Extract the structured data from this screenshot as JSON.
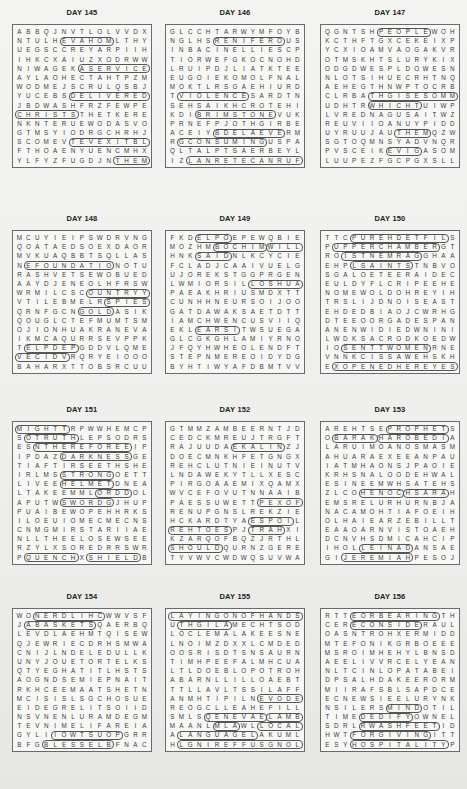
{
  "puzzles": [
    {
      "title": "DAY 145",
      "rows": [
        "ABBQJNVTLOLVVDX",
        "NTULHEVAHOMLTHY",
        "UEGSCCREYARPIIH",
        "IHKCXAIUZXODRWW",
        "NIWAGEKASERVICE",
        "AYLAOHECTAHTPZM",
        "WODMEJSCRULQSBJ",
        "YUCEBSDELIVERED",
        "JBDWASHFRZFEWPE",
        "CHRISTSTHETKERE",
        "NKNTERUEWODASVO",
        "GTMSYIODRGCHRHJ",
        "SCOMEVTEVEXITBL",
        "FTHOAENYUENCMHX",
        "YLFYZFUGDJNTHEM"
      ],
      "highlights": [
        {
          "row": 4,
          "col": 7,
          "len": 8,
          "angle": 0
        },
        {
          "row": 7,
          "col": 6,
          "len": 9,
          "angle": 0
        },
        {
          "row": 9,
          "col": 0,
          "len": 7,
          "angle": 0
        },
        {
          "row": 12,
          "col": 6,
          "len": 9,
          "angle": 0
        },
        {
          "row": 1,
          "col": 5,
          "len": 6,
          "angle": 0
        },
        {
          "row": 14,
          "col": 11,
          "len": 4,
          "angle": 0
        }
      ]
    },
    {
      "title": "DAY 146",
      "rows": [
        "GLCCHTARWYMFOYB",
        "NGLHSRENIFEROUS",
        "INBACINELLIESCP",
        "TIORWEFGKOCNOHD",
        "LRUIPDJLIATKTEE",
        "EUGOIEKOMOLFNAL",
        "MOKTLRSGAEHIURD",
        "TVIOLENCESARDTN",
        "SEHSAIKHCROTEHI",
        "KDIBRIMSTONEVUK",
        "PRNEFPJOTHGIRBE",
        "ACEIYBDELAEVERM",
        "RGCONSUMINGUSPA",
        "QLTALPTSAERBEYL",
        "IZLANRETECANRUF"
      ],
      "highlights": [
        {
          "row": 1,
          "col": 5,
          "len": 8,
          "angle": 0
        },
        {
          "row": 9,
          "col": 3,
          "len": 9,
          "angle": 0
        },
        {
          "row": 11,
          "col": 5,
          "len": 8,
          "angle": 0
        },
        {
          "row": 12,
          "col": 1,
          "len": 10,
          "angle": 0
        },
        {
          "row": 7,
          "col": 1,
          "len": 8,
          "angle": 0
        },
        {
          "row": 14,
          "col": 2,
          "len": 13,
          "angle": 0
        }
      ]
    },
    {
      "title": "DAY 147",
      "rows": [
        "QGNTSHPEOPLEWOH",
        "KCTHFTGXCEKEIXP",
        "YCXIOAMVAOGAKVR",
        "OTMSKHTSLURYKIX",
        "ODGDWESPLDOWESN",
        "NLOTSIHUECRHTNQ",
        "AEHEGTHNWPTOCRB",
        "CLRBATHGISESOMM",
        "UDHTRWHICHTUIWP",
        "LVREDNAGUSAITWZ",
        "REUVIIOANUYPIDD",
        "UYRUUJAUTHEMQZW",
        "SGTOQMNSYADVNQR",
        "PVSCEIKEVIGASOM",
        "LUUPEZFGCPGXSLL"
      ],
      "highlights": [
        {
          "row": 0,
          "col": 6,
          "len": 6,
          "angle": 0
        },
        {
          "row": 7,
          "col": 5,
          "len": 10,
          "angle": 0
        },
        {
          "row": 8,
          "col": 5,
          "len": 6,
          "angle": 0
        },
        {
          "row": 11,
          "col": 8,
          "len": 4,
          "angle": 0
        },
        {
          "row": 13,
          "col": 7,
          "len": 4,
          "angle": 0
        }
      ]
    },
    {
      "title": "DAY 148",
      "rows": [
        "MCUYIEIPSWDRVNG",
        "QOATAEDSOEXDAOR",
        "MVKUAQBBTSQLLAS",
        "NEFOUNDATIONOTU",
        "RASHVETSEWOBUED",
        "AAYDJENEOLHFRSW",
        "WRMILCSCOUNTRYY",
        "VTILEBMELRSPIES",
        "QRNFGCNGOLDASIK",
        "QOUGLCTEFMUMTSM",
        "OJIONHUAKRANEVA",
        "IKMCAQURRSEVPPK",
        "TELPDEPGDDVLQME",
        "VECIDVRQRYEIOOO",
        "BAHARXTTOBSRCUU"
      ],
      "highlights": [
        {
          "row": 3,
          "col": 1,
          "len": 10,
          "angle": 0
        },
        {
          "row": 6,
          "col": 8,
          "len": 7,
          "angle": 0
        },
        {
          "row": 7,
          "col": 10,
          "len": 5,
          "angle": 0
        },
        {
          "row": 8,
          "col": 7,
          "len": 4,
          "angle": 0
        },
        {
          "row": 12,
          "col": 1,
          "len": 6,
          "angle": 0
        },
        {
          "row": 13,
          "col": 0,
          "len": 6,
          "angle": 0
        }
      ]
    },
    {
      "title": "DAY 149",
      "rows": [
        "FKDELPOEPEWQBIE",
        "MOZHMBOCHIMWILL",
        "HNKSAIDNLKCYCIE",
        "FCLADJCAAIVUELG",
        "UJOREKSTGGPRGEN",
        "LWMIORSILLOSHUA",
        "PAEAKHRIUSMDXTT",
        "CUNHHNEURSOIJOO",
        "GATDAWAKSAETDTT",
        "IAMCHWENCUSVIIQ",
        "EKLEARSITWSUEGA",
        "GLCGKGHLAMIYRNO",
        "JFQYHWHEOLENDFT",
        "STEPNMEREOIDYDG",
        "BYHTIWYAFDBMTVV"
      ],
      "highlights": [
        {
          "row": 0,
          "col": 3,
          "len": 4,
          "angle": 0
        },
        {
          "row": 1,
          "col": 5,
          "len": 6,
          "angle": 0
        },
        {
          "row": 1,
          "col": 11,
          "len": 4,
          "angle": 0
        },
        {
          "row": 2,
          "col": 3,
          "len": 4,
          "angle": 0
        },
        {
          "row": 5,
          "col": 9,
          "len": 6,
          "angle": 0
        },
        {
          "row": 10,
          "col": 3,
          "len": 5,
          "angle": 0
        }
      ]
    },
    {
      "title": "DAY 150",
      "rows": [
        "TTCPUREHDETFILS",
        "PUPPERCHAMBERGT",
        "ROISTNEMRAGGHAA",
        "EHPLSAINTSTNBVO",
        "SGALOETEERAIDEC",
        "EULDYFLCRIPEEHE",
        "NOMEWOLDOHREYIH",
        "TRSLIJDNOISEAST",
        "EHDEDBIAOJCWRHG",
        "DTEEOORGADESPAN",
        "ANENWIDIEDWNINI",
        "LWDKSACRODKOEDW",
        "IOSENTTWOMENRNE",
        "VNNKCISSAWEHSKH",
        "EXOPENEDHEREYES"
      ],
      "highlights": [
        {
          "row": 0,
          "col": 3,
          "len": 11,
          "angle": 0
        },
        {
          "row": 1,
          "col": 1,
          "len": 12,
          "angle": 0
        },
        {
          "row": 2,
          "col": 2,
          "len": 9,
          "angle": 0
        },
        {
          "row": 3,
          "col": 3,
          "len": 7,
          "angle": 0
        },
        {
          "row": 12,
          "col": 2,
          "len": 10,
          "angle": 0
        },
        {
          "row": 14,
          "col": 1,
          "len": 14,
          "angle": 0
        }
      ]
    },
    {
      "title": "DAY 151",
      "rows": [
        "MIGHTTRPWWHEMCP",
        "SOTRUTHLEPSODRS",
        "ESNTHEREFOREEIP",
        "IPDAZDARKNESSGE",
        "TIAFTIRSEETHSHE",
        "IRLMSSTRONGOETT",
        "LIVEEHELMETDNEA",
        "LTAKEEMMLORDDOL",
        "APUTWSWORDGJHUP",
        "PUAIBEWOPEHHRKS",
        "ILOEUIOMECMECNS",
        "CNMGMIRSTARIIAE",
        "NLLTHEELOSEWSEE",
        "RZYLXSOREDRRSWR",
        "PQUENCHXSHIELDB"
      ],
      "highlights": [
        {
          "row": 0,
          "col": 0,
          "len": 6,
          "angle": 0
        },
        {
          "row": 1,
          "col": 1,
          "len": 6,
          "angle": 0
        },
        {
          "row": 2,
          "col": 2,
          "len": 11,
          "angle": 0
        },
        {
          "row": 3,
          "col": 5,
          "len": 8,
          "angle": 0
        },
        {
          "row": 5,
          "col": 5,
          "len": 6,
          "angle": 0
        },
        {
          "row": 6,
          "col": 5,
          "len": 6,
          "angle": 0
        },
        {
          "row": 7,
          "col": 9,
          "len": 4,
          "angle": 0
        },
        {
          "row": 8,
          "col": 5,
          "len": 6,
          "angle": 0
        },
        {
          "row": 14,
          "col": 1,
          "len": 6,
          "angle": 0
        },
        {
          "row": 14,
          "col": 8,
          "len": 6,
          "angle": 0
        }
      ]
    },
    {
      "title": "DAY 152",
      "rows": [
        "GTMMZAMBEERNTJD",
        "CEDCKMREUJTRGFT",
        "RAJUUDAEKALINZJ",
        "DOECMNKHFETGNGX",
        "REHCLUTNIEINUTV",
        "LNDAWEKYTLLXESC",
        "PIRGOAAEMIXQAMX",
        "WVCEFOVUTNNAAIB",
        "PAESSUWETTPEXOF",
        "RENUPGNSLREKZIE",
        "HCKARDTYAESPOIL",
        "REHTOESPJTRAHXI",
        "KZARQOFBQZJRTHL",
        "SHOULDQURNZGERE",
        "TYVWVCWDWQSUVWA"
      ],
      "highlights": [
        {
          "row": 2,
          "col": 7,
          "len": 6,
          "angle": 0
        },
        {
          "row": 8,
          "col": 10,
          "len": 5,
          "angle": 0
        },
        {
          "row": 10,
          "col": 9,
          "len": 5,
          "angle": 0
        },
        {
          "row": 11,
          "col": 0,
          "len": 7,
          "angle": 0
        },
        {
          "row": 11,
          "col": 9,
          "len": 4,
          "angle": 0
        },
        {
          "row": 13,
          "col": 0,
          "len": 6,
          "angle": 0
        }
      ]
    },
    {
      "title": "DAY 153",
      "rows": [
        "AREHTSEPROPHETS",
        "OBARAKHAROBEDIA",
        "LARUIMOANOSMASM",
        "AHUARAEXEEANPAU",
        "IATMHAONSJPAOIE",
        "KRHSNALOODEHWAL",
        "ESINEEMWHSATEHS",
        "ZLCOHENOCHSARAH",
        "EMSRELURHURNBJA",
        "NACAMOHTIAFOEIH",
        "OLHAIEARZEBILLT",
        "EAAOARNVISTOAEH",
        "DCNVHSDMICAHCIP",
        "IHOLLEINADANSAE",
        "GIJEREMIAHPESOJ"
      ],
      "highlights": [
        {
          "row": 0,
          "col": 7,
          "len": 7,
          "angle": 0
        },
        {
          "row": 1,
          "col": 1,
          "len": 5,
          "angle": 0
        },
        {
          "row": 1,
          "col": 6,
          "len": 8,
          "angle": 0
        },
        {
          "row": 7,
          "col": 4,
          "len": 5,
          "angle": 0
        },
        {
          "row": 7,
          "col": 9,
          "len": 5,
          "angle": 0
        },
        {
          "row": 13,
          "col": 4,
          "len": 6,
          "angle": 0
        },
        {
          "row": 14,
          "col": 2,
          "len": 8,
          "angle": 0
        }
      ]
    },
    {
      "title": "DAY 154",
      "rows": [
        "WONERDLIHCWWVSF",
        "JABASKETSQAERBQ",
        "LEVDLAEHMTQISEW",
        "QJEWRIECDRHSMWA",
        "CNIJLNDELEDULLK",
        "UNYJOUETORTELKS",
        "QTYEGHATITLHSTS",
        "AOGNDSEMIEPNAIT",
        "RKHCEEMAATSHETN",
        "MCISISLSGCHOSUE",
        "EIDEGRELITSOIID",
        "NSVNENLURAMDEGM",
        "TEVNIMELIFAREIA",
        "GYLIIOWTSUOPGRR",
        "BFGBLESSELBFNAC"
      ],
      "highlights": [
        {
          "row": 0,
          "col": 2,
          "len": 8,
          "angle": 0
        },
        {
          "row": 1,
          "col": 1,
          "len": 8,
          "angle": 0
        },
        {
          "row": 14,
          "col": 3,
          "len": 8,
          "angle": 0
        },
        {
          "row": 13,
          "col": 4,
          "len": 8,
          "angle": 0
        }
      ]
    },
    {
      "title": "DAY 155",
      "rows": [
        "LAYINGONOFHANDS",
        "UTHGILAMECHTSOD",
        "LOCLEMALAKEESNE",
        "LNOIMZDXXLCMDED",
        "OOSRISDTSNSAURN",
        "TIMHPEEFALMHCUA",
        "LTLDOEBLOPOTROH",
        "ABARNLLILLOAEBT",
        "TTLLAVLTSSILAFF",
        "ANMHTIPILNEVODE",
        "REOGCLLEAHEFILL",
        "SMLSQENEVAELAMB",
        "MAANLMLAWLLOCAL",
        "ALANGUAGELAKUML",
        "HLGNIREFFUSGNOL"
      ],
      "highlights": [
        {
          "row": 0,
          "col": 0,
          "len": 15,
          "angle": 0
        },
        {
          "row": 1,
          "col": 1,
          "len": 6,
          "angle": 0
        },
        {
          "row": 9,
          "col": 10,
          "len": 5,
          "angle": 0
        },
        {
          "row": 11,
          "col": 4,
          "len": 7,
          "angle": 0
        },
        {
          "row": 11,
          "col": 11,
          "len": 4,
          "angle": 0
        },
        {
          "row": 12,
          "col": 5,
          "len": 3,
          "angle": 0
        },
        {
          "row": 12,
          "col": 10,
          "len": 5,
          "angle": 0
        },
        {
          "row": 13,
          "col": 1,
          "len": 9,
          "angle": 0
        },
        {
          "row": 14,
          "col": 1,
          "len": 14,
          "angle": 0
        }
      ]
    },
    {
      "title": "DAY 156",
      "rows": [
        "RTTEORBEARINGTH",
        "CERECONSIDERAUL",
        "OASNTROHXERMIDD",
        "MTEFONIKGRBOEEE",
        "MSROIMHEHYLBNSD",
        "AEELIVVRCELYEAN",
        "NLTCINLOPATABEI",
        "DPSALHDAKEERORM",
        "MIIRAFSBLSAPDCE",
        "ECNEWSIEELURYNK",
        "NSILERSMINDOTIL",
        "TIMEDEDIFYOWNEL",
        "SDRLRWASHFEETID",
        "HWTFORGIVINGITT",
        "ESYHOSPITALITYP"
      ],
      "highlights": [
        {
          "row": 0,
          "col": 3,
          "len": 10,
          "angle": 0
        },
        {
          "row": 1,
          "col": 3,
          "len": 8,
          "angle": 0
        },
        {
          "row": 10,
          "col": 7,
          "len": 4,
          "angle": 0
        },
        {
          "row": 11,
          "col": 4,
          "len": 6,
          "angle": 0
        },
        {
          "row": 12,
          "col": 4,
          "len": 9,
          "angle": 0
        },
        {
          "row": 13,
          "col": 3,
          "len": 9,
          "angle": 0
        },
        {
          "row": 14,
          "col": 3,
          "len": 11,
          "angle": 0
        }
      ]
    }
  ]
}
